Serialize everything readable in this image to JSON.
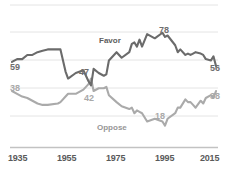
{
  "chart_data": {
    "type": "line",
    "title": "",
    "subtitle": "",
    "xlabel": "",
    "ylabel": "",
    "xlim": [
      1935,
      2015
    ],
    "ylim": [
      0,
      100
    ],
    "grid": true,
    "gridlines_y": [
      20,
      40,
      60,
      80,
      100
    ],
    "legend_position": "inline-annotations",
    "xticks": [
      "1935",
      "1955",
      "1975",
      "1995",
      "2015"
    ],
    "xtick_values": [
      1935,
      1955,
      1975,
      1995,
      2015
    ],
    "series": [
      {
        "name": "Favor",
        "color": "#6b6b6b",
        "x": [
          1935,
          1937,
          1939,
          1941,
          1943,
          1945,
          1947,
          1949,
          1953,
          1954,
          1956,
          1957,
          1960,
          1963,
          1965,
          1966,
          1967,
          1969,
          1971,
          1972,
          1973,
          1976,
          1978,
          1981,
          1982,
          1983,
          1984,
          1985,
          1986,
          1988,
          1991,
          1994,
          1995,
          1996,
          1999,
          2000,
          2001,
          2003,
          2004,
          2005,
          2006,
          2007,
          2009,
          2010,
          2011,
          2013,
          2014,
          2015
        ],
        "values": [
          59,
          61,
          61,
          64,
          64,
          66,
          67,
          68,
          68,
          68,
          52,
          47,
          51,
          53,
          45,
          42,
          54,
          51,
          49,
          50,
          60,
          66,
          62,
          66,
          72,
          73,
          70,
          75,
          70,
          79,
          76,
          80,
          77,
          78,
          71,
          66,
          68,
          64,
          65,
          64,
          65,
          66,
          65,
          64,
          61,
          60,
          63,
          56
        ]
      },
      {
        "name": "Oppose",
        "color": "#aaaaaa",
        "x": [
          1935,
          1937,
          1939,
          1941,
          1943,
          1945,
          1947,
          1949,
          1953,
          1954,
          1956,
          1957,
          1960,
          1963,
          1965,
          1966,
          1967,
          1969,
          1971,
          1972,
          1973,
          1976,
          1978,
          1981,
          1982,
          1983,
          1984,
          1985,
          1986,
          1988,
          1991,
          1994,
          1995,
          1996,
          1999,
          2000,
          2001,
          2003,
          2004,
          2005,
          2006,
          2007,
          2009,
          2010,
          2011,
          2013,
          2014,
          2015
        ],
        "values": [
          38,
          36,
          34,
          33,
          31,
          29,
          28,
          28,
          29,
          30,
          34,
          36,
          36,
          39,
          43,
          47,
          38,
          40,
          40,
          41,
          35,
          30,
          27,
          25,
          26,
          22,
          24,
          23,
          22,
          16,
          18,
          16,
          13,
          18,
          22,
          26,
          26,
          32,
          30,
          30,
          28,
          26,
          31,
          29,
          33,
          35,
          33,
          38
        ]
      }
    ],
    "annotations": [
      {
        "text": "59",
        "series": "Favor",
        "x": 1935,
        "value": 59
      },
      {
        "text": "47",
        "series": "Favor",
        "x": 1970,
        "value": 47
      },
      {
        "text": "78",
        "series": "Favor",
        "x": 1995,
        "value": 78
      },
      {
        "text": "56",
        "series": "Favor",
        "x": 2015,
        "value": 56
      },
      {
        "text": "38",
        "series": "Oppose",
        "x": 1935,
        "value": 38
      },
      {
        "text": "42",
        "series": "Oppose",
        "x": 1972,
        "value": 42
      },
      {
        "text": "18",
        "series": "Oppose",
        "x": 1996,
        "value": 18
      },
      {
        "text": "38",
        "series": "Oppose",
        "x": 2015,
        "value": 38
      }
    ]
  },
  "labels": {
    "favor": "Favor",
    "oppose": "Oppose"
  },
  "annotations": {
    "favor_start": "59",
    "favor_cross": "47",
    "favor_peak": "78",
    "favor_end": "56",
    "oppose_start": "38",
    "oppose_cross": "42",
    "oppose_min": "18",
    "oppose_end": "38"
  },
  "xticks": {
    "t1": "1935",
    "t2": "1955",
    "t3": "1975",
    "t4": "1995",
    "t5": "2015"
  },
  "colors": {
    "favor": "#6b6b6b",
    "oppose": "#aaaaaa",
    "grid": "#e2e2e2",
    "axis": "#c9c9c9",
    "background": "#ffffff"
  }
}
